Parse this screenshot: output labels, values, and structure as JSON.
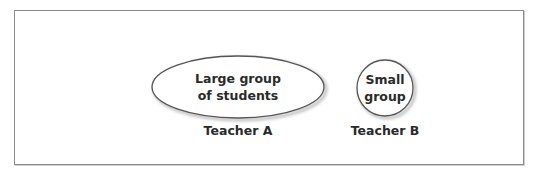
{
  "diagram": {
    "groups": [
      {
        "name": "teacher-a",
        "shape": "ellipse",
        "inner_label_lines": [
          "Large group",
          "of students"
        ],
        "caption": "Teacher A"
      },
      {
        "name": "teacher-b",
        "shape": "circle",
        "inner_label_lines": [
          "Small",
          "group"
        ],
        "caption": "Teacher B"
      }
    ],
    "colors": {
      "border": "#8a8a8a",
      "shape_stroke": "#555555",
      "shape_shadow": "#bdbdbd",
      "text": "#2a2a2a",
      "background": "#ffffff"
    }
  }
}
